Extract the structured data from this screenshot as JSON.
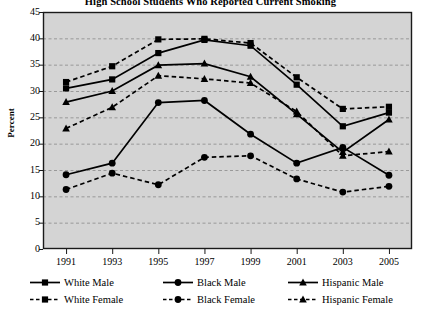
{
  "chart_data": {
    "type": "line",
    "title": "High School Students Who Reported Current Smoking",
    "xlabel": "",
    "ylabel": "Percent",
    "categories": [
      "1991",
      "1993",
      "1995",
      "1997",
      "1999",
      "2001",
      "2003",
      "2005"
    ],
    "x": [
      1991,
      1993,
      1995,
      1997,
      1999,
      2001,
      2003,
      2005
    ],
    "ylim": [
      0,
      45
    ],
    "ytick_values": [
      0,
      5,
      10,
      15,
      20,
      25,
      30,
      35,
      40,
      45
    ],
    "ytick_labels": [
      "0",
      "5",
      "10",
      "15",
      "20",
      "25",
      "30",
      "35",
      "40",
      "45"
    ],
    "grid": true,
    "grid_axis": "y",
    "legend_position": "bottom",
    "plot_background": "#d4d4d4",
    "line_color": "#000000",
    "series": [
      {
        "name": "White Male",
        "marker": "square",
        "linestyle": "solid",
        "values": [
          30.5,
          32.2,
          37.2,
          39.7,
          38.6,
          31.2,
          23.3,
          25.9
        ]
      },
      {
        "name": "White Female",
        "marker": "square",
        "linestyle": "dashed",
        "values": [
          31.7,
          34.7,
          39.8,
          39.9,
          39.1,
          32.6,
          26.6,
          27.0
        ]
      },
      {
        "name": "Black Male",
        "marker": "circle",
        "linestyle": "solid",
        "values": [
          14.1,
          16.3,
          27.8,
          28.2,
          21.8,
          16.3,
          19.3,
          14.0
        ]
      },
      {
        "name": "Black Female",
        "marker": "circle",
        "linestyle": "dashed",
        "values": [
          11.3,
          14.4,
          12.2,
          17.4,
          17.7,
          13.3,
          10.8,
          11.9
        ]
      },
      {
        "name": "Hispanic Male",
        "marker": "triangle",
        "linestyle": "solid",
        "values": [
          27.9,
          30.0,
          34.9,
          35.2,
          32.7,
          25.6,
          18.4,
          24.6
        ]
      },
      {
        "name": "Hispanic Female",
        "marker": "triangle",
        "linestyle": "dashed",
        "values": [
          22.9,
          26.9,
          32.9,
          32.3,
          31.5,
          26.1,
          17.7,
          18.5
        ]
      }
    ]
  },
  "legend": {
    "rows": [
      [
        {
          "label": "White Male",
          "marker": "square",
          "linestyle": "solid"
        },
        {
          "label": "Black Male",
          "marker": "circle",
          "linestyle": "solid"
        },
        {
          "label": "Hispanic Male",
          "marker": "triangle",
          "linestyle": "solid"
        }
      ],
      [
        {
          "label": "White Female",
          "marker": "square",
          "linestyle": "dashed"
        },
        {
          "label": "Black Female",
          "marker": "circle",
          "linestyle": "dashed"
        },
        {
          "label": "Hispanic Female",
          "marker": "triangle",
          "linestyle": "dashed"
        }
      ]
    ]
  }
}
